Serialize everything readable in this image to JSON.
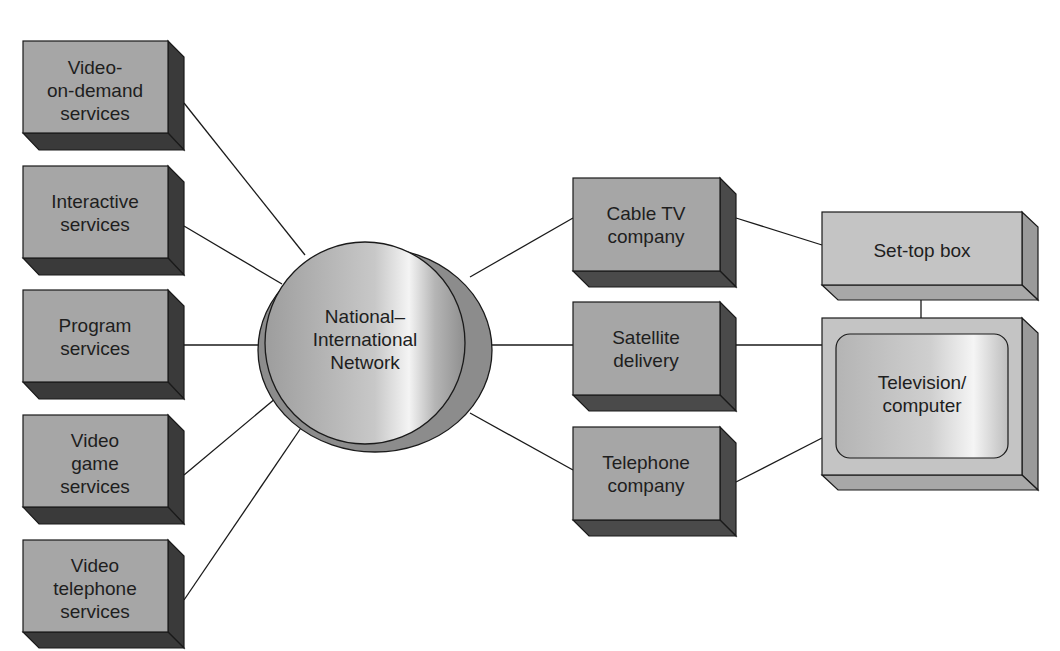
{
  "diagram": {
    "sources": [
      {
        "lines": [
          "Video-",
          "on-demand",
          "services"
        ]
      },
      {
        "lines": [
          "Interactive",
          "services"
        ]
      },
      {
        "lines": [
          "Program",
          "services"
        ]
      },
      {
        "lines": [
          "Video",
          "game",
          "services"
        ]
      },
      {
        "lines": [
          "Video",
          "telephone",
          "services"
        ]
      }
    ],
    "hub": {
      "lines": [
        "National–",
        "International",
        "Network"
      ]
    },
    "carriers": [
      {
        "lines": [
          "Cable TV",
          "company"
        ]
      },
      {
        "lines": [
          "Satellite",
          "delivery"
        ]
      },
      {
        "lines": [
          "Telephone",
          "company"
        ]
      }
    ],
    "set_top_box": {
      "lines": [
        "Set-top box"
      ]
    },
    "display": {
      "lines": [
        "Television/",
        "computer"
      ]
    },
    "colors": {
      "box_face": "#a6a6a6",
      "box_dark_side": "#3a3a3a",
      "light_box_face": "#c4c4c4",
      "light_box_side": "#9a9a9a",
      "line": "#1a1a1a"
    }
  }
}
